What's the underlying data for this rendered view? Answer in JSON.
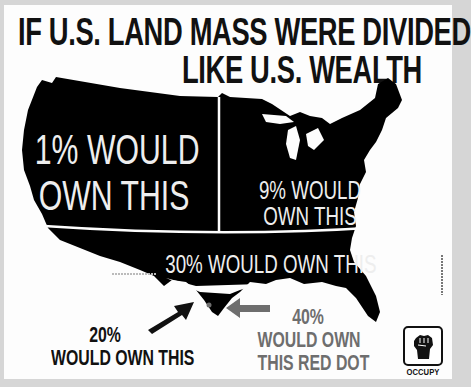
{
  "title": {
    "line1": "IF U.S. LAND MASS WERE DIVIDED",
    "line2": "LIKE U.S. WEALTH"
  },
  "regions": [
    {
      "id": "one-percent",
      "line1": "1% WOULD",
      "line2": "OWN THIS",
      "share_pct": 1
    },
    {
      "id": "nine-percent",
      "line1": "9% WOULD",
      "line2": "OWN THIS",
      "share_pct": 9
    },
    {
      "id": "thirty-percent",
      "line1": "30% WOULD OWN THIS",
      "share_pct": 30
    },
    {
      "id": "twenty-percent",
      "line1": "20%",
      "line2": "WOULD OWN THIS",
      "share_pct": 20
    },
    {
      "id": "forty-percent",
      "line1": "40%",
      "line2": "WOULD OWN",
      "line3": "THIS RED DOT",
      "share_pct": 40
    }
  ],
  "logo": {
    "icon": "raised-fist-icon",
    "label": "OCCUPY"
  },
  "colors": {
    "map": "#000000",
    "background": "#fdfdfd",
    "frame": "#d6d6d6",
    "dot_and_arrow": "#6e6e6e",
    "text_dark": "#111111",
    "text_light": "#eeeeee"
  }
}
